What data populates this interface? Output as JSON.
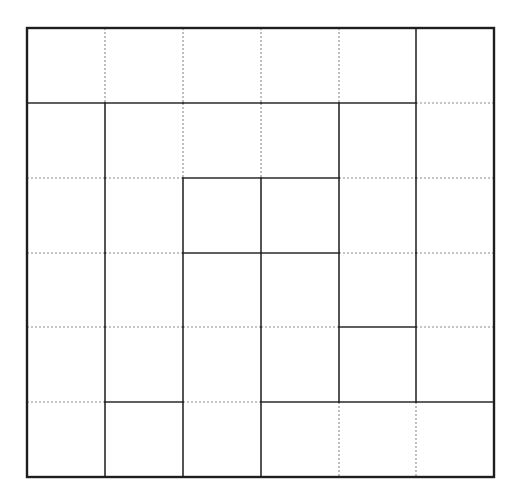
{
  "puzzle": {
    "type": "region-division-grid",
    "rows": 6,
    "cols": 6,
    "colors": {
      "background": "#ffffff",
      "solid": "#2a2a2a",
      "dotted": "#8a8a8a",
      "border": "#1e1e1e"
    },
    "geometry": {
      "x_lines": [
        27,
        105,
        183,
        261,
        339,
        416,
        494
      ],
      "y_lines": [
        28,
        103,
        178,
        253,
        327,
        402,
        477
      ]
    },
    "horizontal_edges": [
      {
        "line": 1,
        "styles": [
          "solid",
          "solid",
          "solid",
          "solid",
          "solid",
          "dotted"
        ]
      },
      {
        "line": 2,
        "styles": [
          "dotted",
          "dotted",
          "solid",
          "solid",
          "dotted",
          "dotted"
        ]
      },
      {
        "line": 3,
        "styles": [
          "dotted",
          "dotted",
          "solid",
          "solid",
          "dotted",
          "dotted"
        ]
      },
      {
        "line": 4,
        "styles": [
          "dotted",
          "dotted",
          "dotted",
          "dotted",
          "solid",
          "dotted"
        ]
      },
      {
        "line": 5,
        "styles": [
          "dotted",
          "solid",
          "dotted",
          "solid",
          "solid",
          "solid"
        ]
      }
    ],
    "vertical_edges": [
      {
        "line": 1,
        "styles": [
          "dotted",
          "solid",
          "solid",
          "solid",
          "solid",
          "solid"
        ]
      },
      {
        "line": 2,
        "styles": [
          "dotted",
          "dotted",
          "solid",
          "solid",
          "solid",
          "solid"
        ]
      },
      {
        "line": 3,
        "styles": [
          "dotted",
          "dotted",
          "solid",
          "solid",
          "solid",
          "solid"
        ]
      },
      {
        "line": 4,
        "styles": [
          "dotted",
          "solid",
          "solid",
          "solid",
          "solid",
          "dotted"
        ]
      },
      {
        "line": 5,
        "styles": [
          "solid",
          "solid",
          "solid",
          "solid",
          "solid",
          "dotted"
        ]
      }
    ]
  }
}
